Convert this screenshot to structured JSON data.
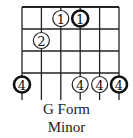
{
  "diagram": {
    "title": "G Form",
    "subtitle": "Minor",
    "strings": 6,
    "frets_visible": 4,
    "grid": {
      "left": 22,
      "right": 119,
      "top": 7,
      "fret_spacing": 22
    },
    "colors": {
      "line": "#222222",
      "bold_circle": "#111111",
      "fill": "#ffffff"
    },
    "dots": [
      {
        "string": 3,
        "fret": 1,
        "label": "1",
        "bold": false
      },
      {
        "string": 4,
        "fret": 1,
        "label": "1",
        "bold": true
      },
      {
        "string": 2,
        "fret": 2,
        "label": "2",
        "bold": false
      },
      {
        "string": 1,
        "fret": 4,
        "label": "4",
        "bold": true
      },
      {
        "string": 4,
        "fret": 4,
        "label": "4",
        "bold": false
      },
      {
        "string": 5,
        "fret": 4,
        "label": "4",
        "bold": false
      },
      {
        "string": 6,
        "fret": 4,
        "label": "4",
        "bold": true
      }
    ]
  }
}
